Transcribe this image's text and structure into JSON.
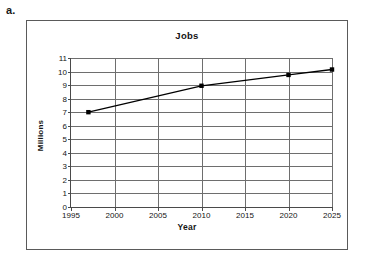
{
  "figure": {
    "label": "a."
  },
  "chart_data": {
    "type": "line",
    "title": "Jobs",
    "xlabel": "Year",
    "ylabel": "Millions",
    "xlim": [
      1995,
      2025
    ],
    "ylim": [
      0,
      11
    ],
    "grid": true,
    "legend": false,
    "x_ticks": [
      1995,
      2000,
      2005,
      2010,
      2015,
      2020,
      2025
    ],
    "y_ticks": [
      0,
      1,
      2,
      3,
      4,
      5,
      6,
      7,
      8,
      9,
      10,
      11
    ],
    "series": [
      {
        "name": "Jobs",
        "marker": "square",
        "color": "#000000",
        "x": [
          1997,
          2010,
          2020,
          2025
        ],
        "values": [
          7.0,
          8.95,
          9.75,
          10.15
        ]
      }
    ]
  }
}
